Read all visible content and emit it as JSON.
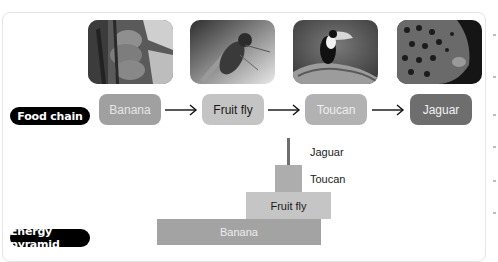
{
  "food_chain": {
    "label": "Food chain",
    "items": [
      {
        "name": "Banana",
        "image": "banana-plant-photo",
        "color": "#a0a0a0",
        "text_color": "#e6e6e6"
      },
      {
        "name": "Fruit fly",
        "image": "fruit-fly-photo",
        "color": "#c4c4c4",
        "text_color": "#1a1a1a"
      },
      {
        "name": "Toucan",
        "image": "toucan-photo",
        "color": "#b2b2b2",
        "text_color": "#eeeeee"
      },
      {
        "name": "Jaguar",
        "image": "jaguar-photo",
        "color": "#6e6e6e",
        "text_color": "#f2f2f2"
      }
    ],
    "arrow_icon": "right-arrow-icon"
  },
  "energy_pyramid": {
    "label": "Energy pyramid",
    "levels": [
      {
        "name": "Banana",
        "color": "#a3a3a3",
        "text_color": "#eeeeee",
        "label_inside": true
      },
      {
        "name": "Fruit fly",
        "color": "#c5c5c5",
        "text_color": "#1a1a1a",
        "label_inside": true
      },
      {
        "name": "Toucan",
        "color": "#adadad",
        "label_inside": false
      },
      {
        "name": "Jaguar",
        "color": "#6f6f6f",
        "label_inside": false
      }
    ]
  }
}
